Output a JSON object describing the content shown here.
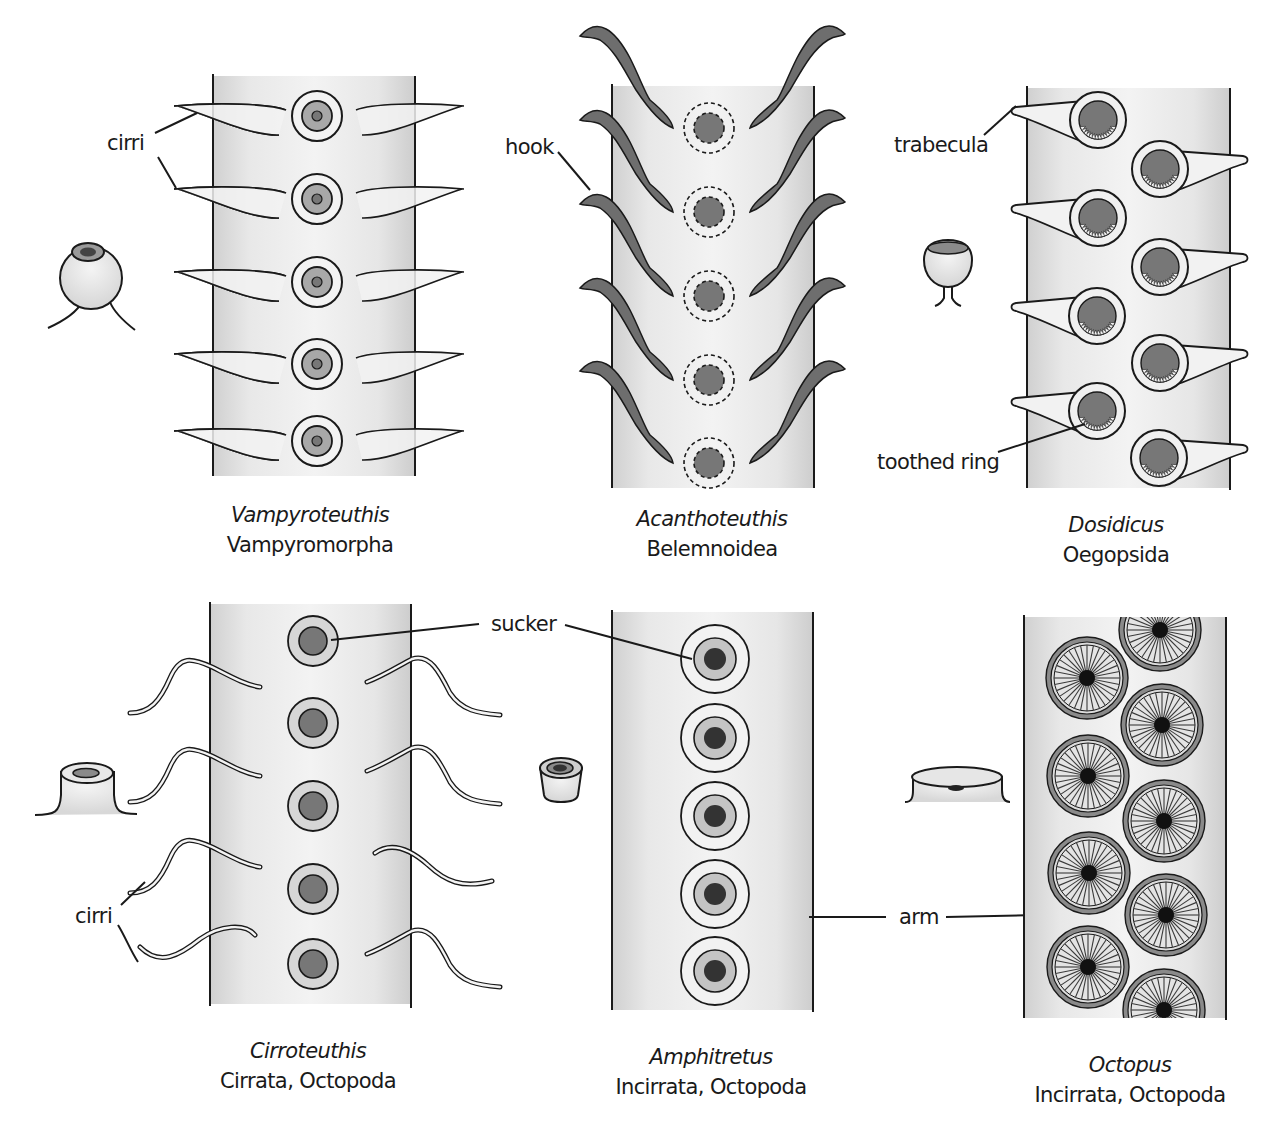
{
  "figure": {
    "colors": {
      "arm_fill": "#e6e6e6",
      "arm_edge_shade": "#cfcfcf",
      "outline": "#1a1a1a",
      "sucker_mid": "#a8a8a8",
      "sucker_dark": "#777777",
      "sucker_darkest": "#333333",
      "hook_fill": "#6e6e6e",
      "cirri_fill": "#f2f2f2"
    }
  },
  "panels": [
    {
      "id": "vampyroteuthis",
      "genus": "Vampyroteuthis",
      "taxon": "Vampyromorpha",
      "arm": {
        "x": 213,
        "y": 76,
        "w": 202,
        "h": 400
      },
      "suckers_y": [
        116,
        199,
        282,
        364,
        441
      ],
      "sucker_x": 317,
      "labels": [
        {
          "text": "cirri",
          "x": 107,
          "y": 131
        }
      ]
    },
    {
      "id": "acanthoteuthis",
      "genus": "Acanthoteuthis",
      "taxon": "Belemnoidea",
      "arm": {
        "x": 612,
        "y": 86,
        "w": 202,
        "h": 402
      },
      "suckers_y": [
        128,
        212,
        296,
        380,
        463
      ],
      "sucker_x": 709,
      "labels": [
        {
          "text": "hook",
          "x": 505,
          "y": 135
        }
      ]
    },
    {
      "id": "dosidicus",
      "genus": "Dosidicus",
      "taxon": "Oegopsida",
      "arm": {
        "x": 1027,
        "y": 86,
        "w": 203,
        "h": 402
      },
      "suckers": [
        {
          "x": 1098,
          "y": 120,
          "side": "left"
        },
        {
          "x": 1160,
          "y": 169,
          "side": "right"
        },
        {
          "x": 1098,
          "y": 218,
          "side": "left"
        },
        {
          "x": 1160,
          "y": 267,
          "side": "right"
        },
        {
          "x": 1097,
          "y": 316,
          "side": "left"
        },
        {
          "x": 1160,
          "y": 363,
          "side": "right"
        },
        {
          "x": 1097,
          "y": 411,
          "side": "left"
        },
        {
          "x": 1159,
          "y": 458,
          "side": "right"
        }
      ],
      "labels": [
        {
          "text": "trabecula",
          "x": 894,
          "y": 133
        },
        {
          "text": "toothed ring",
          "x": 877,
          "y": 450
        }
      ]
    },
    {
      "id": "cirroteuthis",
      "genus": "Cirroteuthis",
      "taxon": "Cirrata, Octopoda",
      "arm": {
        "x": 210,
        "y": 602,
        "w": 201,
        "h": 402
      },
      "suckers_y": [
        641,
        723,
        806,
        889,
        964
      ],
      "sucker_x": 313,
      "labels": [
        {
          "text": "cirri",
          "x": 75,
          "y": 904
        }
      ]
    },
    {
      "id": "amphitretus",
      "genus": "Amphitretus",
      "taxon": "Incirrata, Octopoda",
      "arm": {
        "x": 612,
        "y": 610,
        "w": 201,
        "h": 400
      },
      "suckers_y": [
        659,
        738,
        816,
        894,
        971
      ],
      "sucker_x": 715,
      "labels": [
        {
          "text": "sucker",
          "x": 491,
          "y": 612
        },
        {
          "text": "arm",
          "x": 899,
          "y": 905
        }
      ]
    },
    {
      "id": "octopus",
      "genus": "Octopus",
      "taxon": "Incirrata, Octopoda",
      "arm": {
        "x": 1024,
        "y": 615,
        "w": 202,
        "h": 403
      },
      "suckers": [
        {
          "x": 1160,
          "y": 630
        },
        {
          "x": 1087,
          "y": 678
        },
        {
          "x": 1162,
          "y": 725
        },
        {
          "x": 1088,
          "y": 776
        },
        {
          "x": 1164,
          "y": 821
        },
        {
          "x": 1089,
          "y": 873
        },
        {
          "x": 1166,
          "y": 915
        },
        {
          "x": 1088,
          "y": 967
        },
        {
          "x": 1164,
          "y": 1010
        }
      ],
      "labels": []
    }
  ],
  "captions": [
    {
      "genus": "Vampyroteuthis",
      "taxon": "Vampyromorpha",
      "cx": 310,
      "y": 502
    },
    {
      "genus": "Acanthoteuthis",
      "taxon": "Belemnoidea",
      "cx": 712,
      "y": 506
    },
    {
      "genus": "Dosidicus",
      "taxon": "Oegopsida",
      "cx": 1116,
      "y": 512
    },
    {
      "genus": "Cirroteuthis",
      "taxon": "Cirrata, Octopoda",
      "cx": 308,
      "y": 1038
    },
    {
      "genus": "Amphitretus",
      "taxon": "Incirrata, Octopoda",
      "cx": 711,
      "y": 1044
    },
    {
      "genus": "Octopus",
      "taxon": "Incirrata, Octopoda",
      "cx": 1130,
      "y": 1052
    }
  ],
  "callouts": {
    "cirri_top": "cirri",
    "hook": "hook",
    "trabecula": "trabecula",
    "toothed_ring": "toothed ring",
    "sucker": "sucker",
    "cirri_bottom": "cirri",
    "arm": "arm"
  }
}
